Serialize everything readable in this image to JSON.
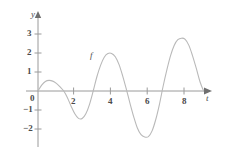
{
  "figure": {
    "background_color": "#ffffff",
    "curve_color": "#b9b9b9",
    "axis_color": "#9a9a9a",
    "text_color": "#4a4a4a"
  },
  "chart_data": {
    "type": "line",
    "title": "",
    "xlabel": "t",
    "ylabel": "y",
    "grid": false,
    "legend": "none",
    "annotations": [
      {
        "text": "f",
        "x": 3.0,
        "y": 1.45
      }
    ],
    "xlim": [
      -0.55,
      10.2
    ],
    "ylim": [
      -2.75,
      3.45
    ],
    "xticks": [
      2,
      4,
      6,
      8
    ],
    "xtick_labels": [
      "2",
      "4",
      "6",
      "8"
    ],
    "yticks": [
      -2,
      -1,
      0,
      1,
      2,
      3
    ],
    "ytick_labels": [
      "−2",
      "−1",
      "0",
      "1",
      "2",
      "3"
    ],
    "origin_label": "0",
    "series": [
      {
        "name": "f",
        "x": [
          0.0,
          0.2,
          0.4,
          0.6,
          0.8,
          1.0,
          1.2,
          1.4,
          1.6,
          1.8,
          2.0,
          2.2,
          2.4,
          2.6,
          2.8,
          3.0,
          3.2,
          3.4,
          3.6,
          3.8,
          4.0,
          4.2,
          4.4,
          4.6,
          4.8,
          5.0,
          5.2,
          5.4,
          5.6,
          5.8,
          6.0,
          6.2,
          6.4,
          6.6,
          6.8,
          7.0,
          7.2,
          7.4,
          7.6,
          7.8,
          8.0,
          8.2,
          8.4,
          8.6,
          8.8,
          9.0
        ],
        "y": [
          0.0,
          0.31,
          0.5,
          0.56,
          0.52,
          0.4,
          0.22,
          0.0,
          -0.35,
          -0.8,
          -1.2,
          -1.44,
          -1.45,
          -1.2,
          -0.7,
          0.0,
          0.75,
          1.35,
          1.78,
          1.97,
          1.98,
          1.8,
          1.4,
          0.8,
          0.1,
          -0.65,
          -1.35,
          -1.95,
          -2.3,
          -2.42,
          -2.4,
          -2.1,
          -1.5,
          -0.7,
          0.25,
          1.1,
          1.85,
          2.4,
          2.7,
          2.78,
          2.72,
          2.4,
          1.85,
          1.2,
          0.5,
          0.0
        ]
      }
    ]
  },
  "axes": {
    "y_axis_name": "y",
    "x_axis_name": "t"
  }
}
